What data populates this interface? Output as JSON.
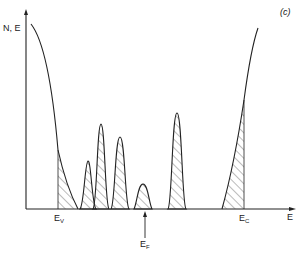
{
  "diagram": {
    "panel_label": "(c)",
    "y_axis_label": "N, E",
    "x_axis_label": "E",
    "markers": [
      {
        "symbol": "E",
        "subscript": "V",
        "name": "valence-band-edge"
      },
      {
        "symbol": "E",
        "subscript": "F",
        "name": "fermi-level"
      },
      {
        "symbol": "E",
        "subscript": "C",
        "name": "conduction-band-edge"
      }
    ],
    "colors": {
      "line": "#222222",
      "hatch": "#444444",
      "background": "#ffffff"
    }
  }
}
